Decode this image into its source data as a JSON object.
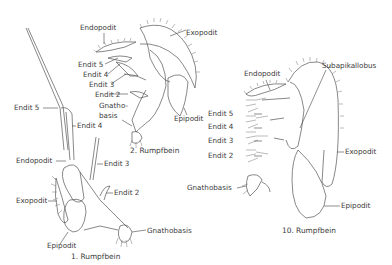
{
  "figures": [
    {
      "caption": "1. Rumpfbein",
      "labels": {
        "endit5": "Endit 5",
        "endit4": "Endit 4",
        "endopodit": "Endopodit",
        "endit3": "Endit 3",
        "exopodit": "Exopodit",
        "endit2": "Endit 2",
        "gnathobasis": "Gnathobasis",
        "epipodit": "Epipodit"
      }
    },
    {
      "caption": "2. Rumpfbein",
      "labels": {
        "endopodit": "Endopodit",
        "exopodit": "Exopodit",
        "endit5": "Endit 5",
        "endit4": "Endit 4",
        "endit3": "Endit 3",
        "endit2": "Endit 2",
        "gnathobasis": "Gnatho-\nbasis",
        "epipodit": "Epipodit"
      }
    },
    {
      "caption": "10. Rumpfbein",
      "labels": {
        "endopodit": "Endopodit",
        "subapikallobus": "Subapikallobus",
        "endit5": "Endit 5",
        "endit4": "Endit 4",
        "endit3": "Endit 3",
        "endit2": "Endit 2",
        "gnathobasis": "Gnathobasis",
        "exopodit": "Exopodit",
        "epipodit": "Epipodit"
      }
    }
  ],
  "colors": {
    "line": "#555555",
    "text": "#3a3a3a",
    "setae": "#777777"
  }
}
